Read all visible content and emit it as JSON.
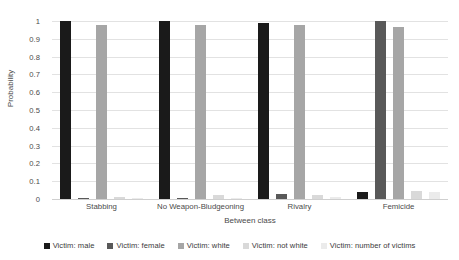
{
  "chart_data": {
    "type": "bar",
    "title": "",
    "xlabel": "Between class",
    "ylabel": "Probability",
    "ylim": [
      0,
      1
    ],
    "yticks": [
      "0",
      "0.1",
      "0.2",
      "0.3",
      "0.4",
      "0.5",
      "0.6",
      "0.7",
      "0.8",
      "0.9",
      "1"
    ],
    "grid": true,
    "legend_position": "bottom",
    "categories": [
      "Stabbing",
      "No Weapon-Bludgeoning",
      "Rivalry",
      "Femicide"
    ],
    "series": [
      {
        "name": "Victim: male",
        "color": "#1a1a1a",
        "values": [
          1.0,
          1.0,
          0.99,
          0.04
        ]
      },
      {
        "name": "Victim: female",
        "color": "#595959",
        "values": [
          0.005,
          0.005,
          0.03,
          1.0
        ]
      },
      {
        "name": "Victim: white",
        "color": "#a6a6a6",
        "values": [
          0.98,
          0.975,
          0.98,
          0.965
        ]
      },
      {
        "name": "Victim: not white",
        "color": "#d9d9d9",
        "values": [
          0.012,
          0.02,
          0.025,
          0.045
        ]
      },
      {
        "name": "Victim: number of victims",
        "color": "#ebebeb",
        "values": [
          0.004,
          0.004,
          0.012,
          0.04
        ]
      }
    ]
  }
}
